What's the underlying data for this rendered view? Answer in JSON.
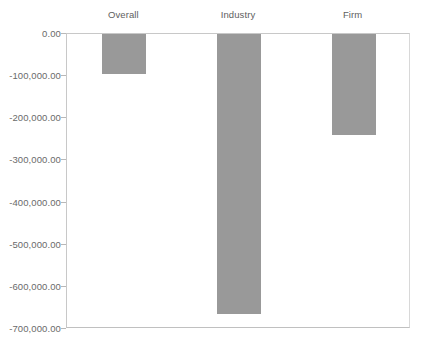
{
  "chart_data": {
    "type": "bar",
    "title": "",
    "subtitle": "",
    "xlabel": "",
    "ylabel": "",
    "categories": [
      "Overall",
      "Industry",
      "Firm"
    ],
    "values": [
      -95000,
      -665000,
      -240000
    ],
    "series": [
      {
        "name": "",
        "values": [
          -95000,
          -665000,
          -240000
        ]
      }
    ],
    "ylim": [
      -700000,
      0
    ],
    "ytick_values": [
      0,
      -100000,
      -200000,
      -300000,
      -400000,
      -500000,
      -600000,
      -700000
    ],
    "ytick_labels": [
      "0.00",
      "-100,000.00",
      "-200,000.00",
      "-300,000.00",
      "-400,000.00",
      "-500,000.00",
      "-600,000.00",
      "-700,000.00"
    ],
    "grid": false,
    "legend": false,
    "legend_position": "none",
    "category_label_position": "top",
    "bar_color": "#999999",
    "axis_color": "#c8c8c8",
    "tick_label_color": "#6a6a6a",
    "annotations": []
  }
}
